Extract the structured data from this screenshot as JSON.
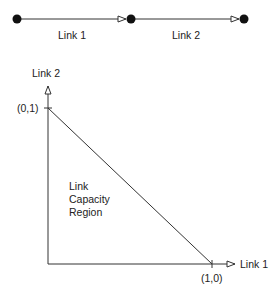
{
  "colors": {
    "line": "#333333",
    "node": "#111111",
    "text": "#222222",
    "background": "#ffffff"
  },
  "network": {
    "nodes": [
      {
        "id": "node-1",
        "x": 17,
        "y": 19
      },
      {
        "id": "node-2",
        "x": 131,
        "y": 19
      },
      {
        "id": "node-3",
        "x": 244,
        "y": 19
      }
    ],
    "links": [
      {
        "label": "Link 1",
        "from": "node-1",
        "to": "node-2"
      },
      {
        "label": "Link 2",
        "from": "node-2",
        "to": "node-3"
      }
    ]
  },
  "capacity_plot": {
    "y_axis_label": "Link 2",
    "x_axis_label": "Link 1",
    "y_intercept_label": "(0,1)",
    "x_intercept_label": "(1,0)",
    "region_label_lines": [
      "Link",
      "Capacity",
      "Region"
    ]
  }
}
